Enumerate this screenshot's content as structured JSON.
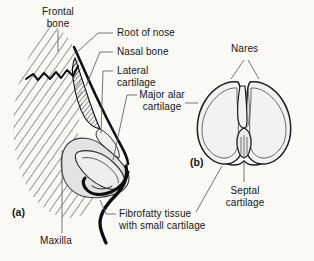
{
  "figure": {
    "background_color": "#fbfaf7",
    "ink_color": "#151515",
    "shade_color": "#e3e3e1",
    "panels": [
      {
        "key": "a",
        "marker": "(a)",
        "description": "lateral view of nose skeleton"
      },
      {
        "key": "b",
        "marker": "(b)",
        "description": "inferior view of nose showing nares"
      }
    ]
  },
  "labels": {
    "frontal_bone": "Frontal\nbone",
    "root_of_nose": "Root of nose",
    "nasal_bone": "Nasal bone",
    "lateral_cartilage": "Lateral\ncartilage",
    "major_alar_cartilage": "Major alar\ncartilage",
    "fibrofatty_tissue": "Fibrofatty tissue\nwith small cartilage",
    "maxilla": "Maxilla",
    "nares": "Nares",
    "septal_cartilage": "Septal\ncartilage",
    "panel_a_marker": "(a)",
    "panel_b_marker": "(b)"
  }
}
